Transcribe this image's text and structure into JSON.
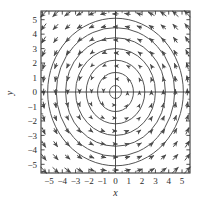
{
  "chart_data": {
    "type": "scatter",
    "subtype": "direction-field-phase-portrait",
    "title": "",
    "subtitle": "",
    "xlabel": "x",
    "ylabel": "y",
    "xlim": [
      -5.6,
      5.6
    ],
    "ylim": [
      -5.6,
      5.6
    ],
    "grid": false,
    "legend": null,
    "x_ticks": [
      -5,
      -4,
      -3,
      -2,
      -1,
      0,
      1,
      2,
      3,
      4,
      5
    ],
    "y_ticks": [
      5,
      4,
      3,
      2,
      1,
      0,
      -1,
      -2,
      -3,
      -4,
      -5
    ],
    "x_tick_labels": [
      "−5",
      "−4",
      "−3",
      "−2",
      "−1",
      "0",
      "1",
      "2",
      "3",
      "4",
      "5"
    ],
    "y_tick_labels": [
      "5",
      "4",
      "3",
      "2",
      "1",
      "0",
      "−1",
      "−2",
      "−3",
      "−4",
      "−5"
    ],
    "minor_tick_step": 0.5,
    "annotations": [],
    "field": {
      "description": "Vector field of a linear center: dx/dt = -y, dy/dt = x. Arrows circulate counterclockwise about the origin.",
      "vx_formula": "-y",
      "vy_formula": "x",
      "rotation": "counterclockwise",
      "equilibrium": [
        0,
        0
      ],
      "equilibrium_type": "center",
      "arrow_grid_step": 0.9,
      "arrow_grid_min": -5.4,
      "arrow_grid_max": 5.4,
      "arrow_scale": 0.085,
      "arrow_max_length": 0.85,
      "arrow_min_length": 0.1
    },
    "trajectories": {
      "description": "Closed circular orbits centered at the origin.",
      "shape": "circle",
      "center": [
        0,
        0
      ],
      "radii": [
        0.45,
        1.35,
        2.2,
        3.0,
        3.75,
        4.45,
        5.1
      ]
    },
    "colors": {
      "axis": "#3a3a3a",
      "frame": "#3a3a3a",
      "trajectory": "#555555",
      "arrow": "#4a4a4a",
      "tick_label": "#2b2b2b",
      "background": "#ffffff"
    }
  },
  "figure": {
    "x_axis_label": "x",
    "y_axis_label": "y"
  }
}
